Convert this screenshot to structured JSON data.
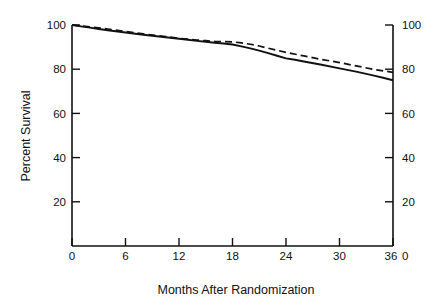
{
  "figure": {
    "background": "#ffffff",
    "ink_color": "#111111"
  },
  "axes": {
    "x_title": "Months After Randomization",
    "y_title_left": "Percent Survival",
    "x_ticks": [
      "0",
      "6",
      "12",
      "18",
      "24",
      "30",
      "36"
    ],
    "y_ticks_left": [
      "100",
      "80",
      "60",
      "40",
      "20"
    ],
    "y_ticks_right": [
      "100",
      "80",
      "60",
      "40",
      "20",
      "0"
    ]
  },
  "chart_data": {
    "type": "line",
    "title": "",
    "subtitle": "",
    "xlabel": "Months After Randomization",
    "ylabel": "Percent Survival",
    "xlim": [
      0,
      36
    ],
    "ylim": [
      0,
      100
    ],
    "x_ticks": [
      0,
      6,
      12,
      18,
      24,
      30,
      36
    ],
    "y_ticks": [
      0,
      20,
      40,
      60,
      80,
      100
    ],
    "grid": false,
    "legend": null,
    "legend_position": "none",
    "annotations": [],
    "note": "Kaplan-Meier style survival curves; left and right y-axes both show Percent Survival 0-100.",
    "series": [
      {
        "name": "solid-curve",
        "style": "solid",
        "color": "#111111",
        "x": [
          0,
          1,
          2,
          3,
          4,
          6,
          8,
          10,
          12,
          13,
          14,
          15,
          16,
          17,
          18,
          19,
          20,
          21,
          22,
          23,
          24,
          25,
          26,
          28,
          30,
          32,
          34,
          35,
          36
        ],
        "values": [
          100,
          99.4,
          98.8,
          98.2,
          97.6,
          96.6,
          95.6,
          94.7,
          93.8,
          93.3,
          92.8,
          92.4,
          92.0,
          91.6,
          91.2,
          90.3,
          89.4,
          88.4,
          87.3,
          86.1,
          84.9,
          84.3,
          83.5,
          82.0,
          80.4,
          78.8,
          77.0,
          76.0,
          75.0
        ]
      },
      {
        "name": "dashed-curve",
        "style": "dashed",
        "color": "#111111",
        "x": [
          0,
          1,
          2,
          3,
          4,
          6,
          8,
          10,
          12,
          13,
          14,
          15,
          16,
          17,
          18,
          19,
          20,
          21,
          22,
          24,
          26,
          28,
          30,
          32,
          34,
          35,
          36
        ],
        "values": [
          100,
          99.6,
          99.2,
          98.7,
          98.2,
          97.1,
          96.0,
          95.0,
          94.0,
          93.6,
          93.2,
          92.9,
          92.6,
          92.5,
          92.4,
          91.9,
          91.3,
          90.5,
          89.5,
          87.6,
          86.0,
          84.4,
          83.0,
          81.4,
          79.8,
          79.2,
          78.6
        ]
      }
    ]
  }
}
